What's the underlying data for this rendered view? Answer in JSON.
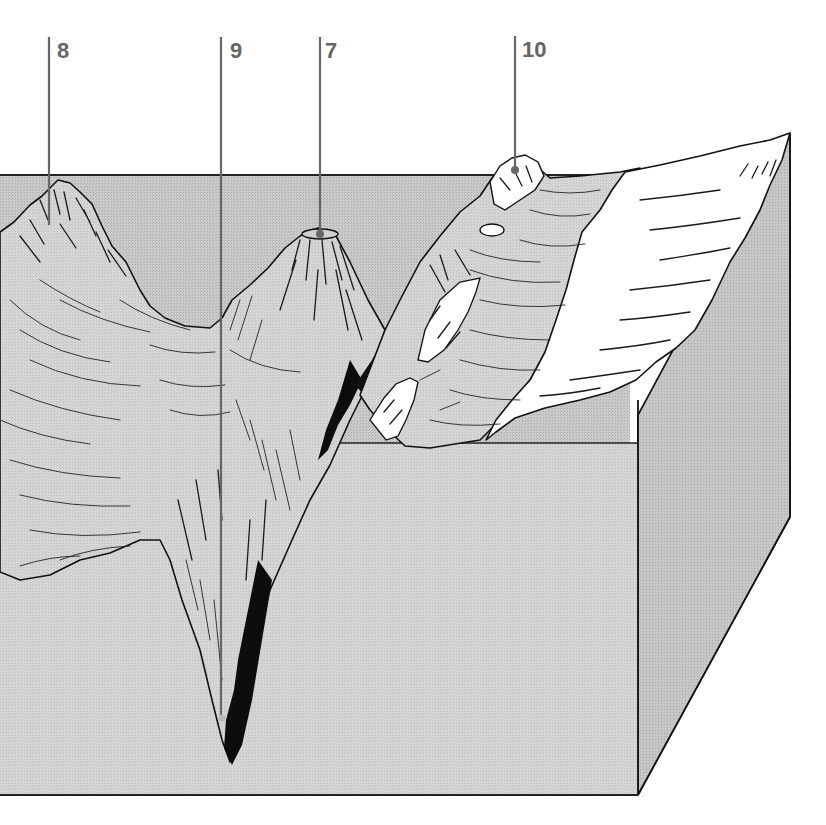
{
  "figure": {
    "type": "ocean-floor block diagram",
    "callouts": [
      {
        "id": "8",
        "label": "8",
        "feature": "seamount peak (left)"
      },
      {
        "id": "9",
        "label": "9",
        "feature": "deep trench bottom"
      },
      {
        "id": "7",
        "label": "7",
        "feature": "flat-topped volcanic seamount (guyot)"
      },
      {
        "id": "10",
        "label": "10",
        "feature": "island arc / continental slope summit"
      }
    ]
  },
  "colors": {
    "background": "#ffffff",
    "block_front_face": "#d9d9d9",
    "block_side_face": "#c4c4c4",
    "block_top_water": "#c8c8c8",
    "terrain_fill": "#cfcfcf",
    "snow_land": "#ffffff",
    "trench_dark": "#0d0d0d",
    "outline": "#111111",
    "callout_line": "#666666",
    "callout_text": "#666666"
  }
}
